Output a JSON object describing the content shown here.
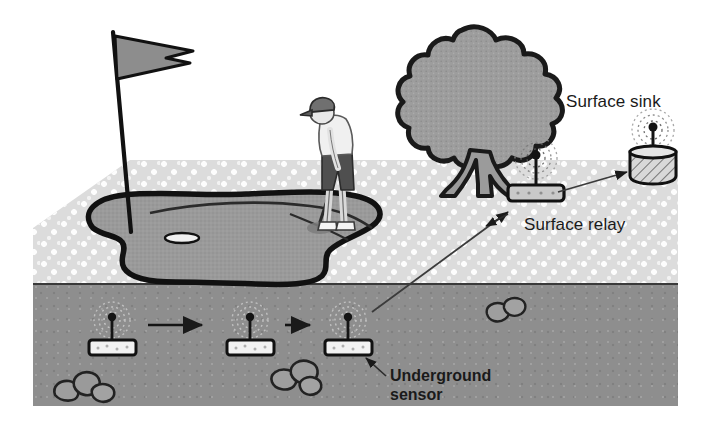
{
  "figure": {
    "type": "cross-section illustration"
  },
  "labels": {
    "surface_sink": "Surface sink",
    "surface_relay": "Surface relay",
    "underground_sensor_line1": "Underground",
    "underground_sensor_line2": "sensor"
  },
  "colors": {
    "grass": "#dcdcdc",
    "grass_dot": "#fdfdfd",
    "soil": "#8e8e8e",
    "green": "#9a9a9a",
    "outline": "#111111",
    "tree_canopy": "#9d9d9d",
    "flag": "#8d8d8d",
    "node_fill": "#f2f2f2",
    "sink_fill": "#d8d8d8",
    "text": "#1a1a1a"
  },
  "scene": {
    "grass_layer": {
      "top": 160,
      "height": 124
    },
    "soil_layer": {
      "top": 284,
      "height": 122,
      "left": 33,
      "width": 645
    }
  },
  "nodes": {
    "underground_sensors": [
      {
        "id": "sensor-1",
        "x": 108,
        "y": 337
      },
      {
        "id": "sensor-2",
        "x": 246,
        "y": 337
      },
      {
        "id": "sensor-3",
        "x": 343,
        "y": 337
      }
    ],
    "surface_relay": {
      "id": "relay",
      "x": 536,
      "y": 176
    },
    "surface_sink": {
      "id": "sink",
      "x": 653,
      "y": 158
    }
  },
  "links": [
    {
      "from": "sensor-1",
      "to": "sensor-2",
      "kind": "underground-hop"
    },
    {
      "from": "sensor-2",
      "to": "sensor-3",
      "kind": "underground-hop"
    },
    {
      "from": "sensor-3",
      "to": "relay",
      "kind": "underground-to-surface"
    },
    {
      "from": "relay",
      "to": "sink",
      "kind": "surface-to-sink"
    }
  ],
  "callouts": [
    {
      "target": "relay",
      "label": "Surface relay"
    },
    {
      "target": "sensor-3",
      "label": "Underground sensor"
    }
  ],
  "decor": {
    "flag": {
      "x": 113,
      "y": 30
    },
    "tree": {
      "x": 460,
      "y": 100
    },
    "golfer": {
      "x": 325,
      "y": 160
    },
    "putting_green": true,
    "hole": {
      "x": 182,
      "y": 237
    },
    "rocks": [
      {
        "x": 75,
        "y": 393
      },
      {
        "x": 290,
        "y": 382
      },
      {
        "x": 500,
        "y": 312
      }
    ]
  }
}
